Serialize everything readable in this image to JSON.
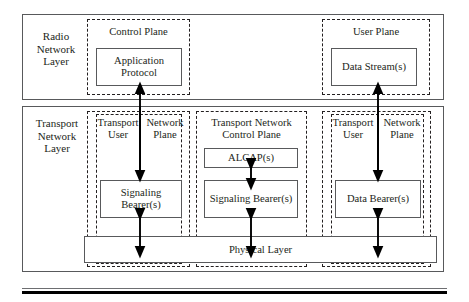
{
  "diagram": {
    "layers": [
      {
        "id": "radio-network-layer",
        "label": "Radio\nNetwork\nLayer"
      },
      {
        "id": "transport-network-layer",
        "label": "Transport\nNetwork\nLayer"
      }
    ],
    "planes": {
      "control_plane": "Control Plane",
      "user_plane": "User Plane",
      "transport_network_control_plane": "Transport Network\nControl Plane",
      "transport_user_left": "Transport\nUser",
      "network_plane_left": "Network\nPlane",
      "transport_user_right": "Transport\nUser",
      "network_plane_right": "Network\nPlane"
    },
    "boxes": {
      "application_protocol": "Application\nProtocol",
      "data_streams": "Data\nStream(s)",
      "alcap": "ALCAP(s)",
      "signaling_bearer_left": "Signaling\nBearer(s)",
      "signaling_bearer_center": "Signaling\nBearer(s)",
      "data_bearer": "Data\nBearer(s)",
      "physical_layer": "Physical Layer"
    },
    "colors": {
      "stroke": "#58595b",
      "dash_stroke": "#231f20",
      "text": "#231f20",
      "background": "#ffffff",
      "rule": "#000000"
    },
    "arrows": [
      {
        "name": "app-protocol-to-signaling-left",
        "direction": "up",
        "from": "Signaling Bearer(s) (left)",
        "to": "Application Protocol"
      },
      {
        "name": "network-plane-to-signaling-left",
        "direction": "down",
        "from": "Network Plane (left)",
        "to": "Signaling Bearer(s) (left)"
      },
      {
        "name": "signaling-left-to-physical",
        "direction": "both",
        "from": "Signaling Bearer(s) (left)",
        "to": "Physical Layer"
      },
      {
        "name": "alcap-to-signaling-center",
        "direction": "both",
        "from": "ALCAP(s)",
        "to": "Signaling Bearer(s) (center)"
      },
      {
        "name": "signaling-center-to-physical",
        "direction": "both",
        "from": "Signaling Bearer(s) (center)",
        "to": "Physical Layer"
      },
      {
        "name": "data-streams-to-data-bearer",
        "direction": "up",
        "from": "Data Bearer(s)",
        "to": "Data Stream(s)"
      },
      {
        "name": "network-plane-to-data-bearer",
        "direction": "down",
        "from": "Network Plane (right)",
        "to": "Data Bearer(s)"
      },
      {
        "name": "data-bearer-to-physical",
        "direction": "both",
        "from": "Data Bearer(s)",
        "to": "Physical Layer"
      }
    ]
  }
}
